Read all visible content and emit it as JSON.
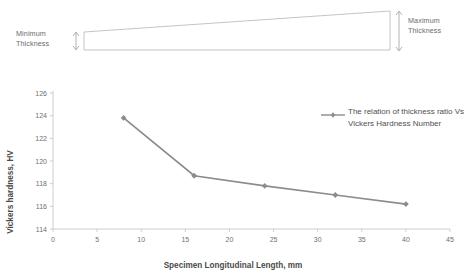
{
  "figure": {
    "wedge": {
      "min_label": "Minimum\nThickness",
      "min_label_line1": "Minimum",
      "min_label_line2": "Thickness",
      "max_label_line1": "Maximum",
      "max_label_line2": "Thickness",
      "outline_color": "#b9b9b9",
      "arrow_color": "#9a9a9a"
    }
  },
  "chart_data": {
    "type": "line",
    "title": "",
    "xlabel": "Specimen Longitudinal Length, mm",
    "ylabel": "Vickers hardness, HV",
    "x": [
      8,
      16,
      24,
      32,
      40
    ],
    "values": [
      123.8,
      118.7,
      117.8,
      117.0,
      116.2
    ],
    "series": [
      {
        "name": "The relation of thickness ratio Vs Vickers Hardness Number",
        "values": [
          123.8,
          118.7,
          117.8,
          117.0,
          116.2
        ]
      }
    ],
    "xlim": [
      0,
      45
    ],
    "ylim": [
      114,
      126
    ],
    "xticks": [
      0,
      5,
      10,
      15,
      20,
      25,
      30,
      35,
      40,
      45
    ],
    "yticks": [
      114,
      116,
      118,
      120,
      122,
      124,
      126
    ],
    "xtick_labels": [
      "0",
      "5",
      "10",
      "15",
      "20",
      "25",
      "30",
      "35",
      "40",
      "45"
    ],
    "ytick_labels": [
      "114",
      "116",
      "118",
      "120",
      "122",
      "124",
      "126"
    ],
    "grid": false,
    "legend_position": "right",
    "legend_entries": [
      "The relation of",
      "thickness ratio",
      "Vs Vickers",
      "Hardness",
      "Number"
    ],
    "series_color": "#8c8c8c",
    "axis_color": "#c8c8c8"
  }
}
